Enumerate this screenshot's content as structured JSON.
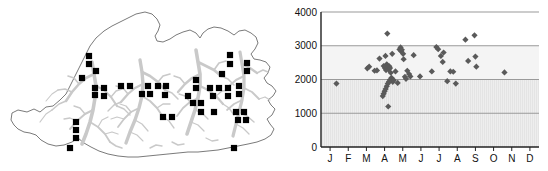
{
  "figure": {
    "panels": [
      {
        "id": "map",
        "kind": "distribution-map",
        "region_label": "Bhutan"
      },
      {
        "id": "chart",
        "kind": "scatter-plot"
      }
    ]
  },
  "map": {
    "region_outline_color": "#6b6b6b",
    "drainage_color": "#c9c9c9",
    "background_color": "#ffffff",
    "record_marker_color": "#000000",
    "record_marker_shape": "square",
    "record_count": 46,
    "records": [
      {
        "x": 89,
        "y": 56
      },
      {
        "x": 89,
        "y": 64
      },
      {
        "x": 96,
        "y": 71
      },
      {
        "x": 82,
        "y": 78
      },
      {
        "x": 95,
        "y": 88
      },
      {
        "x": 95,
        "y": 95
      },
      {
        "x": 121,
        "y": 86
      },
      {
        "x": 130,
        "y": 86
      },
      {
        "x": 142,
        "y": 94
      },
      {
        "x": 150,
        "y": 94
      },
      {
        "x": 158,
        "y": 86
      },
      {
        "x": 166,
        "y": 86
      },
      {
        "x": 163,
        "y": 117
      },
      {
        "x": 172,
        "y": 117
      },
      {
        "x": 76,
        "y": 122
      },
      {
        "x": 76,
        "y": 130
      },
      {
        "x": 76,
        "y": 138
      },
      {
        "x": 70,
        "y": 148
      },
      {
        "x": 196,
        "y": 80
      },
      {
        "x": 196,
        "y": 88
      },
      {
        "x": 210,
        "y": 88
      },
      {
        "x": 219,
        "y": 88
      },
      {
        "x": 193,
        "y": 103
      },
      {
        "x": 201,
        "y": 103
      },
      {
        "x": 201,
        "y": 112
      },
      {
        "x": 214,
        "y": 112
      },
      {
        "x": 222,
        "y": 74
      },
      {
        "x": 230,
        "y": 55
      },
      {
        "x": 230,
        "y": 64
      },
      {
        "x": 228,
        "y": 88
      },
      {
        "x": 228,
        "y": 96
      },
      {
        "x": 239,
        "y": 86
      },
      {
        "x": 239,
        "y": 94
      },
      {
        "x": 236,
        "y": 112
      },
      {
        "x": 244,
        "y": 112
      },
      {
        "x": 238,
        "y": 120
      },
      {
        "x": 246,
        "y": 120
      },
      {
        "x": 234,
        "y": 148
      },
      {
        "x": 247,
        "y": 63
      },
      {
        "x": 247,
        "y": 71
      },
      {
        "x": 213,
        "y": 96
      },
      {
        "x": 188,
        "y": 96
      },
      {
        "x": 104,
        "y": 88
      },
      {
        "x": 104,
        "y": 96
      },
      {
        "x": 148,
        "y": 86
      },
      {
        "x": 165,
        "y": 95
      }
    ]
  },
  "chart_data": {
    "type": "scatter",
    "title": "",
    "subtitle": "",
    "xlabel": "",
    "ylabel": "",
    "grid": true,
    "legend": null,
    "marker": {
      "shape": "diamond",
      "color": "#5a5a5a",
      "size": 5
    },
    "plot_background": {
      "above_3000": "#ffffff",
      "band_2000_3000": "#f2f2f2",
      "below_2000": "#ebebeb_striped"
    },
    "x": {
      "type": "category",
      "categories": [
        "J",
        "F",
        "M",
        "A",
        "M",
        "J",
        "J",
        "A",
        "S",
        "O",
        "N",
        "D"
      ],
      "category_names": [
        "January",
        "February",
        "March",
        "April",
        "May",
        "June",
        "July",
        "August",
        "September",
        "October",
        "November",
        "December"
      ],
      "ticklabels": [
        "J",
        "F",
        "M",
        "A",
        "M",
        "J",
        "J",
        "A",
        "S",
        "O",
        "N",
        "D"
      ]
    },
    "y": {
      "ticks": [
        0,
        1000,
        2000,
        3000,
        4000
      ],
      "ticklabels": [
        "0",
        "1000",
        "2000",
        "3000",
        "4000"
      ],
      "ylim": [
        0,
        4000
      ],
      "gridlines": [
        1000,
        2000,
        3000,
        4000
      ]
    },
    "points": [
      {
        "month": 1.35,
        "value": 1880
      },
      {
        "month": 3.05,
        "value": 2330
      },
      {
        "month": 3.15,
        "value": 2380
      },
      {
        "month": 3.45,
        "value": 2260
      },
      {
        "month": 3.58,
        "value": 2270
      },
      {
        "month": 3.72,
        "value": 2620
      },
      {
        "month": 3.95,
        "value": 2400
      },
      {
        "month": 4.02,
        "value": 2340
      },
      {
        "month": 4.08,
        "value": 2280
      },
      {
        "month": 4.05,
        "value": 2700
      },
      {
        "month": 4.12,
        "value": 2450
      },
      {
        "month": 4.18,
        "value": 2350
      },
      {
        "month": 4.22,
        "value": 2300
      },
      {
        "month": 4.26,
        "value": 2390
      },
      {
        "month": 4.3,
        "value": 2340
      },
      {
        "month": 4.34,
        "value": 2200
      },
      {
        "month": 4.38,
        "value": 2050
      },
      {
        "month": 4.3,
        "value": 1990
      },
      {
        "month": 4.24,
        "value": 1930
      },
      {
        "month": 4.18,
        "value": 1880
      },
      {
        "month": 4.12,
        "value": 1800
      },
      {
        "month": 4.06,
        "value": 1720
      },
      {
        "month": 4.0,
        "value": 1650
      },
      {
        "month": 3.95,
        "value": 1580
      },
      {
        "month": 3.9,
        "value": 1510
      },
      {
        "month": 4.45,
        "value": 1930
      },
      {
        "month": 4.5,
        "value": 1980
      },
      {
        "month": 4.42,
        "value": 2760
      },
      {
        "month": 4.15,
        "value": 3360
      },
      {
        "month": 4.2,
        "value": 1200
      },
      {
        "month": 4.6,
        "value": 2240
      },
      {
        "month": 4.72,
        "value": 1900
      },
      {
        "month": 4.82,
        "value": 2890
      },
      {
        "month": 4.88,
        "value": 2950
      },
      {
        "month": 4.92,
        "value": 2830
      },
      {
        "month": 4.95,
        "value": 2880
      },
      {
        "month": 5.02,
        "value": 2760
      },
      {
        "month": 5.05,
        "value": 2600
      },
      {
        "month": 5.12,
        "value": 2080
      },
      {
        "month": 5.18,
        "value": 2020
      },
      {
        "month": 5.25,
        "value": 2260
      },
      {
        "month": 5.35,
        "value": 2160
      },
      {
        "month": 5.42,
        "value": 2090
      },
      {
        "month": 5.6,
        "value": 2720
      },
      {
        "month": 5.95,
        "value": 2090
      },
      {
        "month": 6.6,
        "value": 2240
      },
      {
        "month": 6.85,
        "value": 2960
      },
      {
        "month": 6.95,
        "value": 2900
      },
      {
        "month": 7.1,
        "value": 2700
      },
      {
        "month": 7.25,
        "value": 2800
      },
      {
        "month": 7.2,
        "value": 2520
      },
      {
        "month": 7.45,
        "value": 1950
      },
      {
        "month": 7.62,
        "value": 2240
      },
      {
        "month": 7.78,
        "value": 2230
      },
      {
        "month": 7.92,
        "value": 1880
      },
      {
        "month": 8.45,
        "value": 3180
      },
      {
        "month": 8.6,
        "value": 2550
      },
      {
        "month": 8.95,
        "value": 3310
      },
      {
        "month": 9.0,
        "value": 2680
      },
      {
        "month": 9.05,
        "value": 2380
      },
      {
        "month": 10.6,
        "value": 2210
      }
    ]
  }
}
